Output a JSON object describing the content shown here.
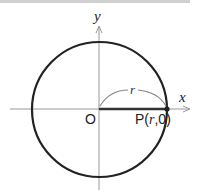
{
  "diagram": {
    "type": "circle-on-coordinate-plane",
    "axes": {
      "x_label": "x",
      "y_label": "y"
    },
    "origin_label": "O",
    "radius_label": "r",
    "point": {
      "name": "P",
      "label_prefix": "P(",
      "label_var": "r",
      "label_suffix": ",0)"
    },
    "colors": {
      "circle": "#222222",
      "axes": "#999999",
      "radius_arc": "#888888",
      "text": "#222222",
      "top_bar": "#cfcfcf"
    }
  }
}
